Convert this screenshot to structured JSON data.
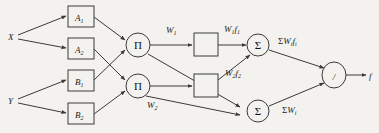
{
  "diagram": {
    "background_color": "#f3f2ef",
    "stroke_color": "#3a3a3a",
    "text_color": "#1b1b1b",
    "inputs": [
      {
        "id": "x",
        "label": "X"
      },
      {
        "id": "y",
        "label": "Y"
      }
    ],
    "membership_boxes": [
      {
        "id": "a1",
        "base": "A",
        "sub": "1"
      },
      {
        "id": "a2",
        "base": "A",
        "sub": "2"
      },
      {
        "id": "b1",
        "base": "B",
        "sub": "1"
      },
      {
        "id": "b2",
        "base": "B",
        "sub": "2"
      }
    ],
    "product_nodes": [
      {
        "id": "pi1",
        "glyph": "Π"
      },
      {
        "id": "pi2",
        "glyph": "Π"
      }
    ],
    "rule_weights": [
      {
        "id": "w1",
        "base": "W",
        "sub": "1"
      },
      {
        "id": "w2",
        "base": "W",
        "sub": "2"
      }
    ],
    "consequent_boxes": [
      {
        "id": "cons1",
        "label": ""
      },
      {
        "id": "cons2",
        "label": ""
      }
    ],
    "weighted_outputs": [
      {
        "id": "wf1",
        "base": "W",
        "sub": "1",
        "base2": "f",
        "sub2": "1"
      },
      {
        "id": "wf2",
        "base": "W",
        "sub": "2",
        "base2": "f",
        "sub2": "2"
      }
    ],
    "sum_nodes": [
      {
        "id": "sum1",
        "glyph": "Σ"
      },
      {
        "id": "sum2",
        "glyph": "Σ"
      }
    ],
    "sum_labels": [
      {
        "id": "sumwf",
        "prefix": "Σ",
        "base": "W",
        "sub": "i",
        "base2": "f",
        "sub2": "i"
      },
      {
        "id": "sumw",
        "prefix": "Σ",
        "base": "W",
        "sub": "i"
      }
    ],
    "division_node": {
      "id": "div",
      "glyph": "/"
    },
    "output": {
      "id": "f",
      "label": "f"
    }
  }
}
